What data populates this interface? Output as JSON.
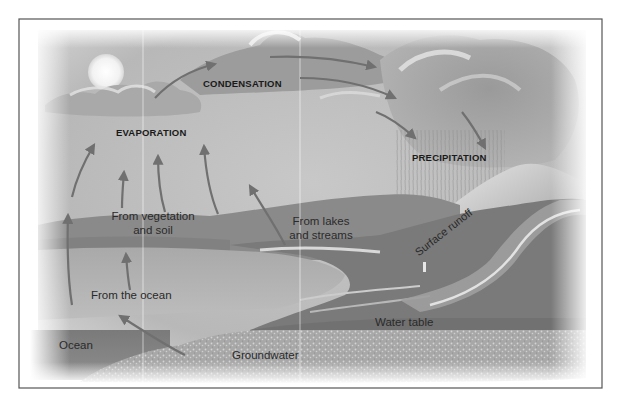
{
  "diagram": {
    "process_labels": {
      "condensation": "CONDENSATION",
      "evaporation": "EVAPORATION",
      "precipitation": "PRECIPITATION"
    },
    "source_labels": {
      "vegetation_line1": "From vegetation",
      "vegetation_line2": "and soil",
      "lakes_line1": "From lakes",
      "lakes_line2": "and streams",
      "ocean": "From the ocean"
    },
    "feature_labels": {
      "surface_runoff": "Surface runoff",
      "water_table": "Water table",
      "ocean": "Ocean",
      "groundwater": "Groundwater"
    },
    "icons": [
      "sun-icon",
      "cloud-icon",
      "arrow-icon",
      "rain-icon",
      "mountain-icon"
    ],
    "colors": {
      "border": "#555555",
      "sky": "#bdbdbd",
      "cloud_dark": "#8e8e8e",
      "cloud_light": "#e6e6e6",
      "arrow": "#7a7a7a",
      "ocean_surface": "#b3b3b3",
      "ocean_deep": "#6f6f6f",
      "hills": "#8a8a8a",
      "ground": "#a0a0a0",
      "groundwater": "#c4c4c4",
      "text": "#1a1a1a"
    }
  }
}
